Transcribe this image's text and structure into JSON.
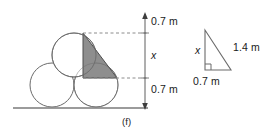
{
  "figure": {
    "caption": "(f)",
    "stack_diagram": {
      "name": "three-circle-stack",
      "circles": [
        {
          "id": "bottom-left-circle",
          "cx": 52,
          "cy": 85,
          "r": 22
        },
        {
          "id": "bottom-right-circle",
          "cx": 96,
          "cy": 85,
          "r": 22
        },
        {
          "id": "top-circle",
          "cx": 74,
          "cy": 55,
          "r": 22
        }
      ],
      "shaded_triangle": {
        "id": "shaded-triangle",
        "points": "83,33 83,78 117,78",
        "fill": "#808080",
        "stroke": "#4d4d4d"
      },
      "ground_line": {
        "x1": 13,
        "y1": 108,
        "x2": 148,
        "y2": 108
      },
      "measure_axis": {
        "x": 145,
        "y_top": 14,
        "y_bottom": 108
      },
      "dashed_guides": [
        {
          "id": "upper-guide",
          "x1": 83,
          "y": 33,
          "x2": 148
        },
        {
          "id": "lower-guide",
          "x1": 83,
          "y": 78,
          "x2": 148
        }
      ],
      "labels": {
        "top_segment": "0.7 m",
        "middle_segment": "x",
        "bottom_segment": "0.7 m"
      }
    },
    "right_triangle": {
      "name": "right-triangle-detail",
      "vertices": {
        "apex": "205,30",
        "right_angle": "205,70",
        "base_right": "231,70"
      },
      "right_angle_marker": true,
      "labels": {
        "vertical_leg": "x",
        "hypotenuse": "1.4 m",
        "horizontal_leg": "0.7 m"
      }
    },
    "colors": {
      "stroke": "#6b6b6b",
      "shade_fill": "#848484",
      "shade_stroke": "#4d4d4d",
      "text": "#1a1a1a",
      "ground": "#7a7a7a",
      "dashed": "#8c8c8c"
    }
  }
}
